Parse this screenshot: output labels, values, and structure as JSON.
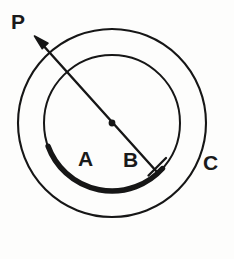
{
  "figure": {
    "background_color": "#fdfdfc",
    "stroke_color": "#161616",
    "canvas": {
      "width": 234,
      "height": 259
    },
    "center": {
      "x": 112,
      "y": 123
    },
    "labels": {
      "p": "P",
      "a": "A",
      "b": "B",
      "c": "C"
    },
    "elements": {
      "outer_circle_name": "outer circle",
      "inner_circle_name": "inner circle",
      "thick_arc_name": "thick arc on inner circle",
      "radius_vector_name": "radius vector P",
      "center_point_name": "center point",
      "tick_mark_name": "tick mark at arc endpoint",
      "arrowhead_name": "arrowhead of vector P"
    },
    "geometry": {
      "outer_radius": 94,
      "inner_radius": 68,
      "thin_stroke_width": 2.1,
      "thick_stroke_width": 5.2,
      "vector_stroke_width": 2.4,
      "thick_arc_start_deg": 160,
      "thick_arc_end_deg": 42,
      "vector_angle_deg": 228,
      "vector_tip": {
        "x": 36,
        "y": 38
      },
      "vector_tail": {
        "x": 157,
        "y": 172
      },
      "center_dot_radius": 3.4
    }
  }
}
